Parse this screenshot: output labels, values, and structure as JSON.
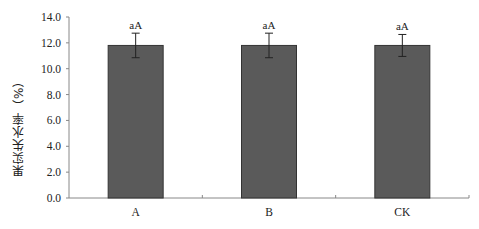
{
  "chart_data": {
    "type": "bar",
    "title": "",
    "xlabel": "",
    "ylabel": "果实失水率（%）",
    "categories": [
      "A",
      "B",
      "CK"
    ],
    "values": [
      11.8,
      11.8,
      11.8
    ],
    "error": [
      0.95,
      0.95,
      0.85
    ],
    "significance_labels": [
      "aA",
      "aA",
      "aA"
    ],
    "ylim": [
      0.0,
      14.0
    ],
    "yticks": [
      "0.0",
      "2.0",
      "4.0",
      "6.0",
      "8.0",
      "10.0",
      "12.0",
      "14.0"
    ],
    "grid": false,
    "legend": null,
    "bar_color": "#5a5a5a",
    "bar_edge_color": "#333333",
    "axis_color": "#888888"
  }
}
